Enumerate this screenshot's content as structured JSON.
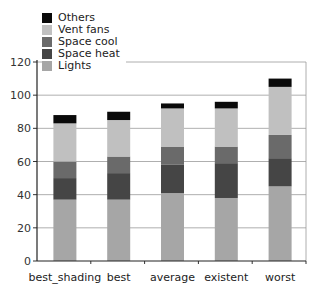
{
  "chart_data": {
    "type": "bar",
    "stacked": true,
    "title": "",
    "xlabel": "",
    "ylabel": "",
    "categories": [
      "best_shading",
      "best",
      "average",
      "existent",
      "worst"
    ],
    "series": [
      {
        "name": "Lights",
        "color": "#a6a6a6",
        "values": [
          37,
          37,
          41,
          38,
          45
        ]
      },
      {
        "name": "Space heat",
        "color": "#454545",
        "values": [
          13,
          16,
          17,
          21,
          17
        ]
      },
      {
        "name": "Space cool",
        "color": "#6a6a6a",
        "values": [
          10,
          10,
          11,
          10,
          14
        ]
      },
      {
        "name": "Vent fans",
        "color": "#c0c0c0",
        "values": [
          23,
          22,
          23,
          23,
          29
        ]
      },
      {
        "name": "Others",
        "color": "#0a0a0a",
        "values": [
          5,
          5,
          3,
          4,
          5
        ]
      }
    ],
    "legend_order": [
      "Others",
      "Vent fans",
      "Space cool",
      "Space heat",
      "Lights"
    ],
    "yticks": [
      0,
      20,
      40,
      60,
      80,
      100,
      120
    ],
    "ylim": [
      0,
      120
    ],
    "grid": true,
    "legend_position": "top-left"
  }
}
